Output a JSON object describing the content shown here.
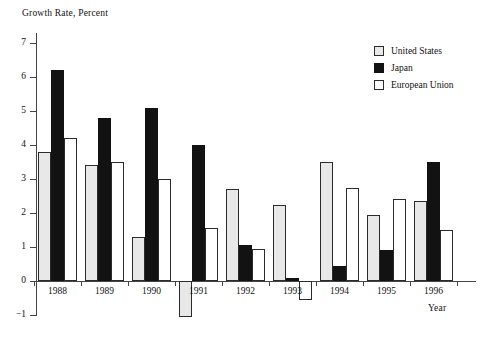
{
  "chart_data": {
    "type": "bar",
    "title": "",
    "ylabel": "Growth Rate, Percent",
    "xlabel": "Year",
    "ylim": [
      -1,
      7
    ],
    "yticks": [
      -1,
      0,
      1,
      2,
      3,
      4,
      5,
      6,
      7
    ],
    "ytick_labels": [
      "−1",
      "0",
      "1",
      "2",
      "3",
      "4",
      "5",
      "6",
      "7"
    ],
    "grid": false,
    "legend_position": "top-right",
    "categories": [
      "1988",
      "1989",
      "1990",
      "1991",
      "1992",
      "1993",
      "1994",
      "1995",
      "1996"
    ],
    "series": [
      {
        "name": "United States",
        "color": "#e8e8e8",
        "values": [
          3.8,
          3.4,
          1.3,
          -1.05,
          2.7,
          2.25,
          3.5,
          1.95,
          2.35
        ]
      },
      {
        "name": "Japan",
        "color": "#121212",
        "values": [
          6.2,
          4.8,
          5.1,
          4.0,
          1.05,
          0.1,
          0.45,
          0.9,
          3.5
        ]
      },
      {
        "name": "European Union",
        "color": "#ffffff",
        "values": [
          4.2,
          3.5,
          3.0,
          1.55,
          0.95,
          -0.55,
          2.75,
          2.4,
          1.5
        ]
      }
    ]
  },
  "legend": {
    "items": [
      {
        "label": "United States",
        "key": "us"
      },
      {
        "label": "Japan",
        "key": "jp"
      },
      {
        "label": "European Union",
        "key": "eu"
      }
    ]
  }
}
